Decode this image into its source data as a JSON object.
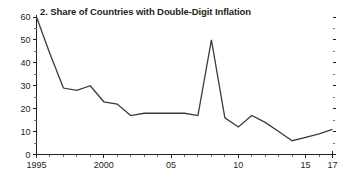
{
  "panel": {
    "number": "2.",
    "title": "2. Share of Countries with Double-Digit Inflation",
    "background": "#ffffff",
    "line_color": "#3b3b3d",
    "axis_color": "#231f20"
  },
  "chart_data": {
    "type": "line",
    "title": "2. Share of Countries with Double-Digit Inflation",
    "xlabel": "",
    "ylabel": "",
    "xlim": [
      1995,
      2017
    ],
    "ylim": [
      0,
      60
    ],
    "yticks": [
      0,
      10,
      20,
      30,
      40,
      50,
      60
    ],
    "ytick_labels": [
      "0",
      "10",
      "20",
      "30",
      "40",
      "50",
      "60"
    ],
    "y_minor_step": 5,
    "xticks": [
      1995,
      1996,
      1997,
      1998,
      1999,
      2000,
      2001,
      2002,
      2003,
      2004,
      2005,
      2006,
      2007,
      2008,
      2009,
      2010,
      2011,
      2012,
      2013,
      2014,
      2015,
      2016,
      2017
    ],
    "xtick_labels": [
      {
        "x": 1995,
        "label": "1995"
      },
      {
        "x": 2000,
        "label": "2000"
      },
      {
        "x": 2005,
        "label": "05"
      },
      {
        "x": 2010,
        "label": "10"
      },
      {
        "x": 2015,
        "label": "15"
      },
      {
        "x": 2017,
        "label": "17"
      }
    ],
    "grid": false,
    "legend": false,
    "x": [
      1995,
      1996,
      1997,
      1998,
      1999,
      2000,
      2001,
      2002,
      2003,
      2004,
      2005,
      2006,
      2007,
      2008,
      2009,
      2010,
      2011,
      2012,
      2013,
      2014,
      2015,
      2016,
      2017
    ],
    "values": [
      60,
      44,
      29,
      28,
      30,
      23,
      22,
      17,
      18,
      18,
      18,
      18,
      17,
      50,
      16,
      12,
      17,
      14,
      10,
      6,
      7.5,
      9,
      11
    ],
    "series": [
      {
        "name": "Share of countries with double-digit inflation",
        "values": [
          60,
          44,
          29,
          28,
          30,
          23,
          22,
          17,
          18,
          18,
          18,
          18,
          17,
          50,
          16,
          12,
          17,
          14,
          10,
          6,
          7.5,
          9,
          11
        ]
      }
    ]
  }
}
